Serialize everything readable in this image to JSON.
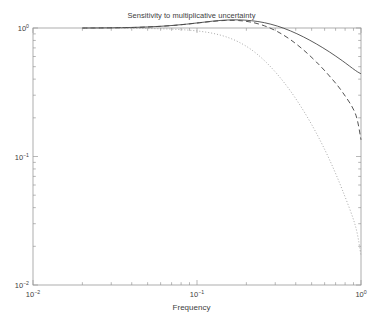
{
  "chart_data": {
    "type": "line",
    "title": "Sensitivity to multiplicative uncertainty",
    "xlabel": "Frequency",
    "ylabel": "",
    "xscale": "log",
    "yscale": "log",
    "xlim": [
      0.01,
      1.0
    ],
    "ylim": [
      0.01,
      1.0
    ],
    "grid": false,
    "legend": "none",
    "xticklabels": [
      "10^-2",
      "10^-1",
      "10^0"
    ],
    "xtickvalues": [
      0.01,
      0.1,
      1.0
    ],
    "yticklabels": [
      "10^0",
      "10^-1",
      "10^-2"
    ],
    "ytickvalues": [
      1.0,
      0.1,
      0.01
    ],
    "series": [
      {
        "name": "solid",
        "style": "solid",
        "color": "#3d3d3d",
        "x": [
          0.02,
          0.024,
          0.0288,
          0.0346,
          0.0415,
          0.0498,
          0.0598,
          0.0718,
          0.0862,
          0.1035,
          0.1242,
          0.149,
          0.1788,
          0.2146,
          0.2576,
          0.3091,
          0.371,
          0.4452,
          0.5343,
          0.6412,
          0.7694,
          0.9233,
          1.0
        ],
        "y": [
          1.0,
          1.001,
          1.003,
          1.006,
          1.011,
          1.019,
          1.031,
          1.048,
          1.071,
          1.1,
          1.13,
          1.152,
          1.157,
          1.14,
          1.1,
          1.035,
          0.95,
          0.853,
          0.752,
          0.652,
          0.556,
          0.468,
          0.44
        ]
      },
      {
        "name": "dashed",
        "style": "dashed",
        "color": "#4a4a4a",
        "x": [
          0.02,
          0.024,
          0.0288,
          0.0346,
          0.0415,
          0.0498,
          0.0598,
          0.0718,
          0.0862,
          0.1035,
          0.1242,
          0.149,
          0.1788,
          0.2146,
          0.2576,
          0.3091,
          0.371,
          0.4452,
          0.5343,
          0.6412,
          0.7694,
          0.9233,
          1.0
        ],
        "y": [
          0.999,
          1.0,
          1.002,
          1.005,
          1.01,
          1.018,
          1.03,
          1.047,
          1.07,
          1.098,
          1.126,
          1.145,
          1.143,
          1.11,
          1.04,
          0.938,
          0.812,
          0.676,
          0.544,
          0.424,
          0.318,
          0.216,
          0.135
        ]
      },
      {
        "name": "dotted",
        "style": "dotted",
        "color": "#9a9a9a",
        "x": [
          0.02,
          0.024,
          0.0288,
          0.0346,
          0.0415,
          0.0498,
          0.0598,
          0.0718,
          0.0862,
          0.1035,
          0.1242,
          0.149,
          0.1788,
          0.2146,
          0.2576,
          0.3091,
          0.371,
          0.4452,
          0.5343,
          0.6412,
          0.7694,
          0.9233,
          1.0
        ],
        "y": [
          0.998,
          0.998,
          0.997,
          0.996,
          0.994,
          0.991,
          0.986,
          0.978,
          0.965,
          0.944,
          0.91,
          0.857,
          0.78,
          0.678,
          0.558,
          0.436,
          0.324,
          0.228,
          0.152,
          0.095,
          0.055,
          0.029,
          0.017
        ]
      }
    ]
  }
}
